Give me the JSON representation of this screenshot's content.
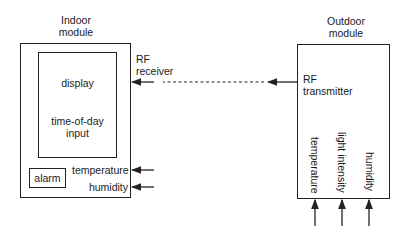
{
  "indoor_module": {
    "title_line1": "Indoor",
    "title_line2": "module",
    "display_box": {
      "label1": "display",
      "label2_line1": "time-of-day",
      "label2_line2": "input"
    },
    "alarm": "alarm",
    "inputs": {
      "temperature": "temperature",
      "humidity": "humidity"
    },
    "rf_receiver_line1": "RF",
    "rf_receiver_line2": "receiver"
  },
  "outdoor_module": {
    "title_line1": "Outdoor",
    "title_line2": "module",
    "rf_transmitter_line1": "RF",
    "rf_transmitter_line2": "transmitter",
    "sensors": [
      "temperature",
      "light intensity",
      "humidity"
    ]
  },
  "link": {
    "style": "dashed",
    "direction": "outdoor-to-indoor"
  }
}
